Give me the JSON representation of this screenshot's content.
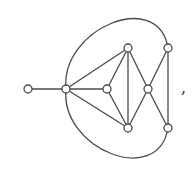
{
  "diagram": {
    "type": "graph",
    "node_radius": 4,
    "colors": {
      "stroke": "#4a4a4a",
      "node_fill": "#ffffff",
      "background": "#ffffff"
    },
    "nodes": [
      {
        "id": "A",
        "x": 28,
        "y": 89
      },
      {
        "id": "B",
        "x": 66,
        "y": 89
      },
      {
        "id": "C",
        "x": 128,
        "y": 48
      },
      {
        "id": "D",
        "x": 107,
        "y": 89
      },
      {
        "id": "E",
        "x": 128,
        "y": 128
      },
      {
        "id": "F",
        "x": 168,
        "y": 48
      },
      {
        "id": "G",
        "x": 148,
        "y": 89
      },
      {
        "id": "H",
        "x": 168,
        "y": 128
      }
    ],
    "edges": [
      {
        "from": "A",
        "to": "B",
        "kind": "line"
      },
      {
        "from": "B",
        "to": "C",
        "kind": "line"
      },
      {
        "from": "B",
        "to": "D",
        "kind": "line"
      },
      {
        "from": "B",
        "to": "E",
        "kind": "line"
      },
      {
        "from": "C",
        "to": "D",
        "kind": "line"
      },
      {
        "from": "C",
        "to": "E",
        "kind": "line"
      },
      {
        "from": "D",
        "to": "E",
        "kind": "line"
      },
      {
        "from": "C",
        "to": "G",
        "kind": "line"
      },
      {
        "from": "E",
        "to": "G",
        "kind": "line"
      },
      {
        "from": "G",
        "to": "F",
        "kind": "line"
      },
      {
        "from": "G",
        "to": "H",
        "kind": "line"
      },
      {
        "from": "F",
        "to": "H",
        "kind": "line"
      },
      {
        "from": "B",
        "to": "F",
        "kind": "arc-top"
      },
      {
        "from": "B",
        "to": "H",
        "kind": "arc-bottom"
      }
    ],
    "trailing_punctuation": ","
  }
}
